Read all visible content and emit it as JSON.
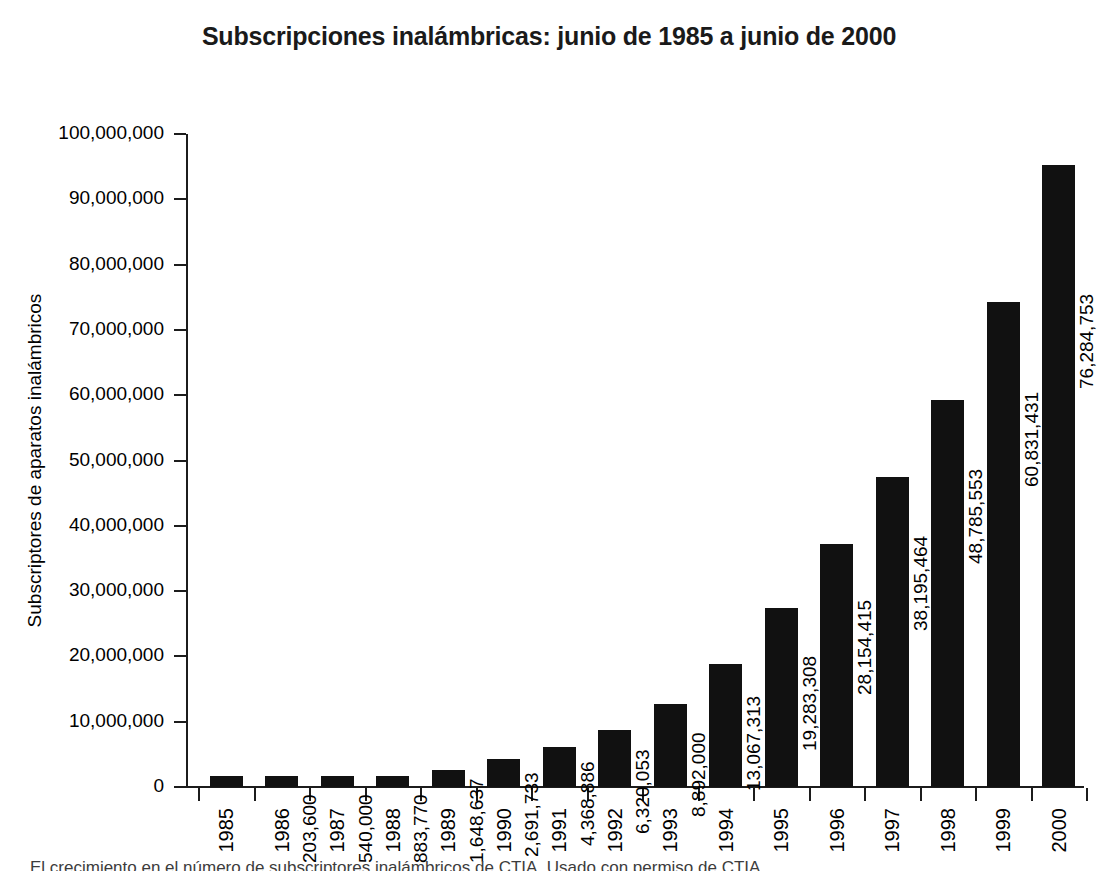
{
  "chart_data": {
    "type": "bar",
    "title": "Subscripciones inalámbricas: junio de 1985 a junio de 2000",
    "xlabel": "",
    "ylabel": "Subscriptores de aparatos inalámbricos",
    "categories": [
      "1985",
      "1986",
      "1987",
      "1988",
      "1989",
      "1990",
      "1991",
      "1992",
      "1993",
      "1994",
      "1995",
      "1996",
      "1997",
      "1998",
      "1999",
      "2000"
    ],
    "values": [
      203600,
      540000,
      883770,
      1648637,
      2691733,
      4368886,
      6320053,
      8892000,
      13067313,
      19283308,
      28154415,
      38195464,
      48785553,
      60831431,
      76284753,
      97835925
    ],
    "value_labels": [
      "203,600",
      "540,000",
      "883,770",
      "1,648,637",
      "2,691,733",
      "4,368,886",
      "6,320,053",
      "8,892,000",
      "13,067,313",
      "19,283,308",
      "28,154,415",
      "38,195,464",
      "48,785,553",
      "60,831,431",
      "76,284,753",
      "97,835,925"
    ],
    "ylim": [
      0,
      100000000
    ],
    "ytick_values": [
      0,
      10000000,
      20000000,
      30000000,
      40000000,
      50000000,
      60000000,
      70000000,
      80000000,
      90000000,
      100000000
    ],
    "ytick_labels": [
      "0",
      "10,000,000",
      "20,000,000",
      "30,000,000",
      "40,000,000",
      "50,000,000",
      "60,000,000",
      "70,000,000",
      "80,000,000",
      "90,000,000",
      "100,000,000"
    ],
    "grid": false,
    "legend": null,
    "bar_color": "#111111",
    "background_color": "#ffffff",
    "value_labels_rotation": 90,
    "xtick_labels_rotation": 90
  },
  "caption": {
    "text": "El crecimiento en el número de subscriptores inalámbricos de CTIA. Usado con permiso de CTIA."
  }
}
